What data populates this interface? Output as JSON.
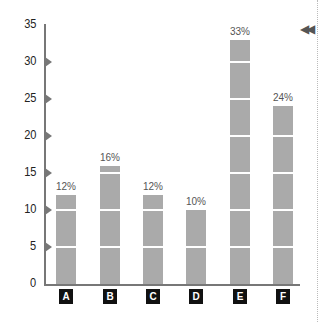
{
  "chart_data": {
    "type": "bar",
    "title": "",
    "xlabel": "",
    "ylabel": "",
    "categories": [
      "A",
      "B",
      "C",
      "D",
      "E",
      "F"
    ],
    "values": [
      12,
      16,
      12,
      10,
      33,
      24
    ],
    "value_labels": [
      "12%",
      "16%",
      "12%",
      "10%",
      "33%",
      "24%"
    ],
    "ylim": [
      0,
      35
    ],
    "yticks": [
      "0",
      "5",
      "10",
      "15",
      "20",
      "25",
      "30",
      "35"
    ],
    "grid": false,
    "legend": null,
    "bar_color": "#aaaaaa"
  },
  "controls": {
    "rewind_icon": "◀◀"
  }
}
